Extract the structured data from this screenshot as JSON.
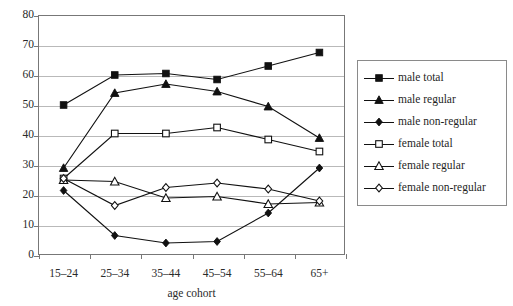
{
  "chart_data": {
    "type": "line",
    "title": "",
    "xlabel": "age cohort",
    "ylabel": "",
    "categories": [
      "15–24",
      "25–34",
      "35–44",
      "45–54",
      "55–64",
      "65+"
    ],
    "ylim": [
      0,
      80
    ],
    "ytick_values": [
      0,
      10,
      20,
      30,
      40,
      50,
      60,
      70,
      80
    ],
    "ytick_labels": [
      "0",
      "10",
      "20",
      "30",
      "40",
      "50",
      "60",
      "70",
      "80"
    ],
    "grid": true,
    "legend_position": "right",
    "series": [
      {
        "name": "male total",
        "marker": "filled-square",
        "values": [
          50,
          60,
          60.5,
          58.5,
          63,
          67.5
        ]
      },
      {
        "name": "male regular",
        "marker": "filled-triangle",
        "values": [
          29,
          54,
          57,
          54.5,
          49.5,
          39
        ]
      },
      {
        "name": "male non-regular",
        "marker": "filled-diamond",
        "values": [
          21.5,
          6.5,
          4,
          4.5,
          14,
          29
        ]
      },
      {
        "name": "female total",
        "marker": "open-square",
        "values": [
          25.5,
          40.5,
          40.5,
          42.5,
          38.5,
          34.5
        ]
      },
      {
        "name": "female regular",
        "marker": "open-triangle",
        "values": [
          25,
          24.5,
          19,
          19.5,
          17,
          17.5
        ]
      },
      {
        "name": "female non-regular",
        "marker": "open-diamond",
        "values": [
          25.5,
          16.5,
          22.5,
          24,
          22,
          18
        ]
      }
    ]
  },
  "legend": {
    "items": [
      {
        "label": "male total",
        "marker": "filled-square"
      },
      {
        "label": "male regular",
        "marker": "filled-triangle"
      },
      {
        "label": "male non-regular",
        "marker": "filled-diamond"
      },
      {
        "label": "female total",
        "marker": "open-square"
      },
      {
        "label": "female regular",
        "marker": "open-triangle"
      },
      {
        "label": "female non-regular",
        "marker": "open-diamond"
      }
    ]
  },
  "colors": {
    "line": "#111111",
    "grid": "#b9b9b9",
    "frame": "#777777",
    "text": "#1f1f1f",
    "background": "#ffffff"
  }
}
